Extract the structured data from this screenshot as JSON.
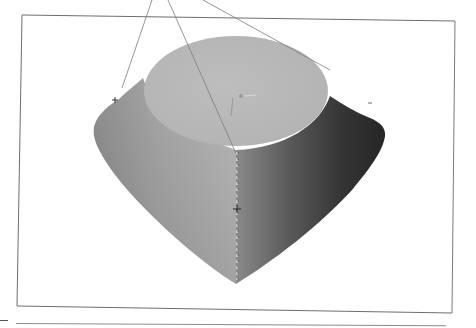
{
  "figure": {
    "type": "3d-render-viewport",
    "colors": {
      "background": "#ffffff",
      "frame": "#6e6e6e",
      "top_face": "#b9b9b9",
      "side_light": "#a8a8a8",
      "side_mid": "#7a7a7a",
      "side_dark": "#2e2e2e",
      "construction_line": "#7c7c7c"
    },
    "frame": {
      "x": 18,
      "y": 15,
      "width": 436,
      "height": 295
    },
    "shape": {
      "top_ellipse": {
        "cx": 236,
        "cy": 91,
        "rx": 92,
        "ry": 52
      },
      "apex": {
        "x": 236,
        "y": 284
      },
      "left_corner": {
        "x": 95,
        "y": 125
      },
      "right_corner": {
        "x": 385,
        "y": 130
      }
    },
    "markers": [
      {
        "name": "left-marker",
        "x": 115,
        "y": 100
      },
      {
        "name": "center-marker",
        "x": 237,
        "y": 208
      },
      {
        "name": "top-marker",
        "x": 240,
        "y": 95
      }
    ]
  }
}
